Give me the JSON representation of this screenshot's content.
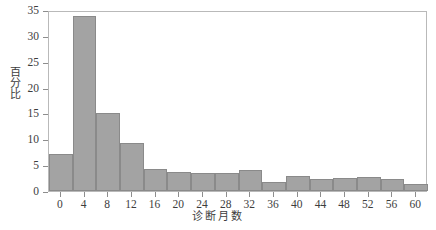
{
  "chart_data": {
    "type": "bar",
    "title": "",
    "subtitle": "",
    "xlabel": "诊断月数",
    "ylabel": "百分比",
    "xlim": [
      -2,
      62
    ],
    "ylim": [
      0,
      35
    ],
    "grid": false,
    "legend": null,
    "bar_color": "#a3a3a3",
    "bar_edge_color": "#8a8a8a",
    "x_ticks": [
      0,
      4,
      8,
      12,
      16,
      20,
      24,
      28,
      32,
      36,
      40,
      44,
      48,
      52,
      56,
      60
    ],
    "x_tick_labels": [
      "0",
      "4",
      "8",
      "12",
      "16",
      "20",
      "24",
      "28",
      "32",
      "36",
      "40",
      "44",
      "48",
      "52",
      "56",
      "60"
    ],
    "y_ticks": [
      0,
      5,
      10,
      15,
      20,
      25,
      30,
      35
    ],
    "y_tick_labels": [
      "0",
      "5",
      "10",
      "15",
      "20",
      "25",
      "30",
      "35"
    ],
    "categories": [
      "-2–2",
      "2–6",
      "6–10",
      "10–14",
      "14–18",
      "18–22",
      "22–26",
      "26–30",
      "30–34",
      "34–38",
      "38–42",
      "42–46",
      "46–50",
      "50–54",
      "54–58",
      "58–62"
    ],
    "bins": [
      {
        "label": "-2–2",
        "x0": -2,
        "x1": 2,
        "value": 7.1
      },
      {
        "label": "2–6",
        "x0": 2,
        "x1": 6,
        "value": 33.8
      },
      {
        "label": "6–10",
        "x0": 6,
        "x1": 10,
        "value": 15.0
      },
      {
        "label": "10–14",
        "x0": 10,
        "x1": 14,
        "value": 9.3
      },
      {
        "label": "14–18",
        "x0": 14,
        "x1": 18,
        "value": 4.3
      },
      {
        "label": "18–22",
        "x0": 18,
        "x1": 22,
        "value": 3.7
      },
      {
        "label": "22–26",
        "x0": 22,
        "x1": 26,
        "value": 3.5
      },
      {
        "label": "26–30",
        "x0": 26,
        "x1": 30,
        "value": 3.5
      },
      {
        "label": "30–34",
        "x0": 30,
        "x1": 34,
        "value": 4.1
      },
      {
        "label": "34–38",
        "x0": 34,
        "x1": 38,
        "value": 1.7
      },
      {
        "label": "38–42",
        "x0": 38,
        "x1": 42,
        "value": 2.9
      },
      {
        "label": "42–46",
        "x0": 42,
        "x1": 46,
        "value": 2.3
      },
      {
        "label": "46–50",
        "x0": 46,
        "x1": 50,
        "value": 2.5
      },
      {
        "label": "50–54",
        "x0": 50,
        "x1": 54,
        "value": 2.7
      },
      {
        "label": "54–58",
        "x0": 54,
        "x1": 58,
        "value": 2.4
      },
      {
        "label": "58–62",
        "x0": 58,
        "x1": 62,
        "value": 1.3
      }
    ],
    "values": [
      7.1,
      33.8,
      15.0,
      9.3,
      4.3,
      3.7,
      3.5,
      3.5,
      4.1,
      1.7,
      2.9,
      2.3,
      2.5,
      2.7,
      2.4,
      1.3
    ]
  }
}
